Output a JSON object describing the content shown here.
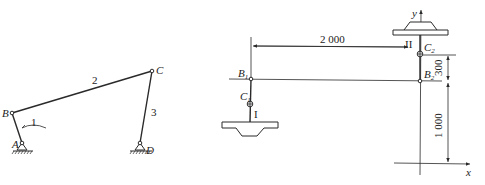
{
  "figure_left": {
    "title": "four-bar linkage",
    "joints": {
      "A": "A",
      "B": "B",
      "C": "C",
      "D": "D"
    },
    "links": {
      "link1": "1",
      "link2": "2",
      "link3": "3"
    }
  },
  "figure_right": {
    "points": {
      "B1": {
        "main": "B",
        "sub": "1"
      },
      "C1": {
        "main": "C",
        "sub": "1"
      },
      "B2": {
        "main": "B",
        "sub": "2"
      },
      "C2": {
        "main": "C",
        "sub": "2"
      }
    },
    "positions": {
      "pos1": "I",
      "pos2": "II"
    },
    "axes": {
      "x": "x",
      "y": "y"
    },
    "dimensions": {
      "horizontal": "2 000",
      "vertical_upper": "300",
      "vertical_lower": "1 000"
    }
  },
  "colors": {
    "ink": "#2a2a2a",
    "background": "#ffffff"
  }
}
